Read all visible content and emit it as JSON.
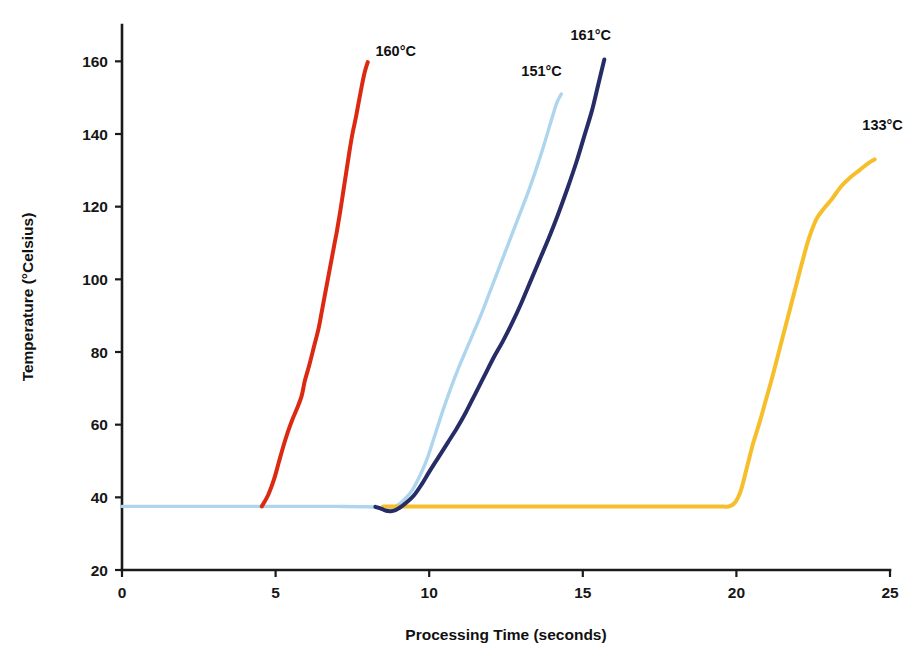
{
  "chart_data": {
    "type": "line",
    "title": "",
    "xlabel": "Processing Time (seconds)",
    "ylabel": "Temperature (°Celsius)",
    "xlim": [
      0,
      25
    ],
    "ylim": [
      20,
      170
    ],
    "xticks": [
      "0",
      "5",
      "10",
      "15",
      "20",
      "25"
    ],
    "xtick_values": [
      0,
      5,
      10,
      15,
      20,
      25
    ],
    "yticks": [
      "20",
      "40",
      "60",
      "80",
      "100",
      "120",
      "140",
      "160"
    ],
    "ytick_values": [
      20,
      40,
      60,
      80,
      100,
      120,
      140,
      160
    ],
    "grid": false,
    "legend_position": "inline-end-labels",
    "baseline_temperature": 37.5,
    "series": [
      {
        "name": "160°C",
        "label": "160°C",
        "color": "#DC2A12",
        "label_x": 8.25,
        "label_y": 161.5,
        "peak_value": 160,
        "onset_time": 4.6,
        "x": [
          4.55,
          4.75,
          4.95,
          5.1,
          5.25,
          5.4,
          5.55,
          5.7,
          5.85,
          5.95,
          6.1,
          6.25,
          6.4,
          6.5,
          6.6,
          6.7,
          6.8,
          6.9,
          7.0,
          7.1,
          7.2,
          7.3,
          7.4,
          7.5,
          7.6,
          7.7,
          7.8,
          7.9,
          8.0
        ],
        "y": [
          37.5,
          40.5,
          45.0,
          49.5,
          54.0,
          58.0,
          61.5,
          64.5,
          68.0,
          72.0,
          76.5,
          81.5,
          86.5,
          91.0,
          95.5,
          100.0,
          104.5,
          109.0,
          113.5,
          118.5,
          124.0,
          129.5,
          135.0,
          140.0,
          144.0,
          148.5,
          153.0,
          157.0,
          159.8
        ]
      },
      {
        "name": "151°C",
        "label": "151°C",
        "color": "#AED5EE",
        "label_x": 13.0,
        "label_y": 156.0,
        "peak_value": 151,
        "onset_time": 9.3,
        "x": [
          0.0,
          1.0,
          2.0,
          3.0,
          4.0,
          5.0,
          6.0,
          7.0,
          8.0,
          8.5,
          8.8,
          9.0,
          9.2,
          9.45,
          9.7,
          9.95,
          10.2,
          10.45,
          10.7,
          10.95,
          11.2,
          11.45,
          11.7,
          11.95,
          12.2,
          12.45,
          12.7,
          12.95,
          13.2,
          13.45,
          13.7,
          13.95,
          14.15,
          14.3
        ],
        "y": [
          37.5,
          37.5,
          37.5,
          37.5,
          37.5,
          37.5,
          37.5,
          37.5,
          37.4,
          37.0,
          37.2,
          38.0,
          39.5,
          42.0,
          46.0,
          51.0,
          57.5,
          64.0,
          70.0,
          75.5,
          80.5,
          85.5,
          90.5,
          96.0,
          101.5,
          107.0,
          112.5,
          118.0,
          123.5,
          129.5,
          136.0,
          143.0,
          148.5,
          151.0
        ]
      },
      {
        "name": "161°C",
        "label": "161°C",
        "color": "#262D66",
        "label_x": 14.6,
        "label_y": 166.0,
        "peak_value": 161,
        "onset_time": 9.5,
        "x": [
          8.25,
          8.45,
          8.6,
          8.75,
          8.9,
          9.05,
          9.25,
          9.5,
          9.75,
          10.0,
          10.3,
          10.6,
          10.9,
          11.2,
          11.5,
          11.8,
          12.1,
          12.4,
          12.7,
          13.0,
          13.3,
          13.6,
          13.9,
          14.2,
          14.5,
          14.8,
          15.05,
          15.3,
          15.5,
          15.7
        ],
        "y": [
          37.4,
          36.8,
          36.3,
          36.2,
          36.5,
          37.2,
          38.5,
          40.5,
          43.5,
          47.0,
          51.0,
          55.0,
          59.0,
          63.5,
          68.5,
          73.5,
          78.5,
          83.0,
          88.0,
          93.5,
          99.5,
          105.5,
          111.5,
          118.0,
          125.0,
          132.5,
          139.5,
          146.5,
          153.5,
          160.5
        ]
      },
      {
        "name": "133°C",
        "label": "133°C",
        "color": "#F5BE2A",
        "label_x": 24.1,
        "label_y": 141.0,
        "peak_value": 133,
        "onset_time": 19.9,
        "x": [
          8.5,
          10.0,
          12.0,
          14.0,
          16.0,
          18.0,
          19.3,
          19.75,
          19.95,
          20.15,
          20.35,
          20.55,
          20.75,
          20.95,
          21.15,
          21.35,
          21.55,
          21.75,
          21.95,
          22.15,
          22.35,
          22.6,
          22.85,
          23.1,
          23.4,
          23.7,
          24.0,
          24.3,
          24.5
        ],
        "y": [
          37.5,
          37.5,
          37.5,
          37.5,
          37.5,
          37.5,
          37.5,
          37.5,
          38.5,
          42.0,
          48.5,
          55.0,
          60.5,
          66.5,
          72.5,
          79.0,
          85.5,
          92.0,
          98.5,
          105.0,
          111.0,
          116.5,
          119.5,
          122.0,
          125.5,
          128.0,
          130.0,
          132.0,
          133.0
        ]
      }
    ]
  }
}
